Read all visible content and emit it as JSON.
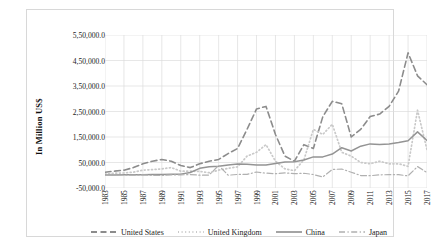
{
  "chart_data": {
    "type": "line",
    "title": "",
    "xlabel": "",
    "ylabel": "In Million US$",
    "ylim": [
      -50000,
      550000
    ],
    "ystep": 100000,
    "grid": true,
    "legend_position": "bottom",
    "y_ticks": [
      "-50,000.0",
      "50,000.0",
      "1,50,000.0",
      "2,50,000.0",
      "3,50,000.0",
      "4,50,000.0",
      "5,50,000.0"
    ],
    "y_tick_values": [
      -50000,
      50000,
      150000,
      250000,
      350000,
      450000,
      550000
    ],
    "x": [
      1983,
      1984,
      1985,
      1986,
      1987,
      1988,
      1989,
      1990,
      1991,
      1992,
      1993,
      1994,
      1995,
      1996,
      1997,
      1998,
      1999,
      2000,
      2001,
      2002,
      2003,
      2004,
      2005,
      2006,
      2007,
      2008,
      2009,
      2010,
      2011,
      2012,
      2013,
      2014,
      2015,
      2016,
      2017
    ],
    "x_tick_labels": [
      "1983",
      "1985",
      "1987",
      "1989",
      "1991",
      "1993",
      "1995",
      "1997",
      "1999",
      "2001",
      "2003",
      "2005",
      "2007",
      "2009",
      "2011",
      "2013",
      "2015",
      "2017"
    ],
    "x_tick_values": [
      1983,
      1985,
      1987,
      1989,
      1991,
      1993,
      1995,
      1997,
      1999,
      2001,
      2003,
      2005,
      2007,
      2009,
      2011,
      2013,
      2015,
      2017
    ],
    "series": [
      {
        "name": "United States",
        "style": "dashed",
        "color": "#8c8c8c",
        "values": [
          12000,
          16000,
          20000,
          30000,
          45000,
          55000,
          62000,
          55000,
          38000,
          30000,
          45000,
          55000,
          62000,
          85000,
          105000,
          180000,
          260000,
          270000,
          160000,
          75000,
          55000,
          120000,
          105000,
          230000,
          290000,
          280000,
          150000,
          180000,
          230000,
          240000,
          270000,
          330000,
          480000,
          390000,
          355000
        ]
      },
      {
        "name": "United Kingdom",
        "style": "dotted",
        "color": "#c9c9c9",
        "values": [
          5000,
          8000,
          9000,
          12000,
          20000,
          22000,
          25000,
          30000,
          16000,
          16000,
          15000,
          10000,
          20000,
          27000,
          33000,
          75000,
          90000,
          120000,
          55000,
          25000,
          18000,
          60000,
          180000,
          160000,
          200000,
          90000,
          75000,
          50000,
          45000,
          55000,
          45000,
          45000,
          35000,
          255000,
          100000
        ]
      },
      {
        "name": "China",
        "style": "solid",
        "color": "#949494",
        "values": [
          900,
          1200,
          1600,
          1900,
          2300,
          3200,
          3400,
          3500,
          4400,
          11000,
          27000,
          33000,
          35000,
          40000,
          44000,
          43000,
          40000,
          40000,
          46000,
          52000,
          53000,
          60000,
          72000,
          72000,
          83000,
          108000,
          95000,
          114000,
          123000,
          121000,
          123000,
          128000,
          135000,
          170000,
          136000
        ]
      },
      {
        "name": "Japan",
        "style": "dashdot",
        "color": "#b0b0b0",
        "values": [
          -600,
          -400,
          1000,
          500,
          1200,
          -500,
          -1000,
          1800,
          1400,
          2700,
          200,
          900,
          39000,
          200,
          3200,
          3300,
          12700,
          8200,
          6200,
          9200,
          6300,
          7800,
          2800,
          -6500,
          22500,
          24400,
          11900,
          -1200,
          -1800,
          1700,
          2300,
          2100,
          -2300,
          34000,
          10400
        ]
      }
    ]
  },
  "legend": {
    "items": [
      {
        "label": "United States"
      },
      {
        "label": "United Kingdom"
      },
      {
        "label": "China"
      },
      {
        "label": "Japan"
      }
    ]
  }
}
